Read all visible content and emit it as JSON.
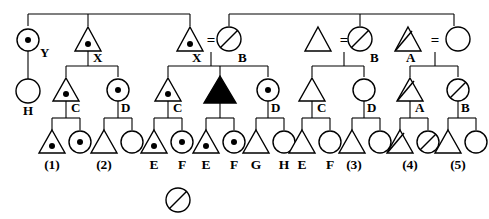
{
  "diagram": {
    "colors": {
      "stroke": "#000000",
      "fill_open": "#ffffff",
      "fill_affected": "#000000"
    },
    "symbol_legend": {
      "triangle": "male",
      "circle": "female",
      "dot": "carrier-dot-marker",
      "slash": "slash-marker",
      "filled": "affected-filled",
      "equals": "mating-union"
    },
    "union_symbol": "=",
    "generations": [
      {
        "name": "generation-1",
        "y": 40,
        "individuals": [
          {
            "id": "g1-1",
            "shape": "circle",
            "marker": "dot",
            "label": "Y",
            "x": 28
          },
          {
            "id": "g1-2",
            "shape": "triangle",
            "marker": "dot",
            "label": "X",
            "x": 88
          },
          {
            "id": "g1-3",
            "shape": "triangle",
            "marker": "dot",
            "label": "X",
            "x": 190
          },
          {
            "id": "g1-4",
            "shape": "circle",
            "marker": "slash",
            "label": "B",
            "x": 229
          },
          {
            "id": "g1-5",
            "shape": "triangle",
            "marker": "none",
            "label": "",
            "x": 318
          },
          {
            "id": "g1-6",
            "shape": "circle",
            "marker": "slash",
            "label": "B",
            "x": 360
          },
          {
            "id": "g1-7",
            "shape": "triangle",
            "marker": "slash",
            "label": "A",
            "x": 408
          },
          {
            "id": "g1-8",
            "shape": "circle",
            "marker": "none",
            "label": "",
            "x": 454
          }
        ]
      },
      {
        "name": "generation-2",
        "y": 90,
        "individuals": [
          {
            "id": "g2-1",
            "shape": "circle",
            "marker": "none",
            "label": "H",
            "x": 28
          },
          {
            "id": "g2-2",
            "shape": "triangle",
            "marker": "dot",
            "label": "C",
            "x": 66
          },
          {
            "id": "g2-3",
            "shape": "circle",
            "marker": "dot",
            "label": "D",
            "x": 118
          },
          {
            "id": "g2-4",
            "shape": "triangle",
            "marker": "dot",
            "label": "C",
            "x": 168
          },
          {
            "id": "g2-5",
            "shape": "triangle",
            "marker": "filled",
            "label": "",
            "x": 220
          },
          {
            "id": "g2-6",
            "shape": "circle",
            "marker": "dot",
            "label": "D",
            "x": 268
          },
          {
            "id": "g2-7",
            "shape": "triangle",
            "marker": "none",
            "label": "C",
            "x": 312
          },
          {
            "id": "g2-8",
            "shape": "circle",
            "marker": "none",
            "label": "D",
            "x": 364
          },
          {
            "id": "g2-9",
            "shape": "triangle",
            "marker": "slash",
            "label": "A",
            "x": 410
          },
          {
            "id": "g2-10",
            "shape": "circle",
            "marker": "slash",
            "label": "B",
            "x": 458
          }
        ]
      },
      {
        "name": "generation-3",
        "y": 141,
        "individuals": [
          {
            "id": "g3-1",
            "shape": "triangle",
            "marker": "dot",
            "label": "(1)",
            "x": 52
          },
          {
            "id": "g3-2",
            "shape": "circle",
            "marker": "dot",
            "label": "",
            "x": 80
          },
          {
            "id": "g3-3",
            "shape": "triangle",
            "marker": "none",
            "label": "(2)",
            "x": 104
          },
          {
            "id": "g3-4",
            "shape": "circle",
            "marker": "none",
            "label": "",
            "x": 132
          },
          {
            "id": "g3-5",
            "shape": "triangle",
            "marker": "dot",
            "label": "E",
            "x": 154
          },
          {
            "id": "g3-6",
            "shape": "circle",
            "marker": "dot",
            "label": "F",
            "x": 182
          },
          {
            "id": "g3-7",
            "shape": "triangle",
            "marker": "dot",
            "label": "E",
            "x": 206
          },
          {
            "id": "g3-8",
            "shape": "circle",
            "marker": "dot",
            "label": "F",
            "x": 234
          },
          {
            "id": "g3-9",
            "shape": "triangle",
            "marker": "none",
            "label": "G",
            "x": 256
          },
          {
            "id": "g3-10",
            "shape": "circle",
            "marker": "none",
            "label": "H",
            "x": 284
          },
          {
            "id": "g3-11",
            "shape": "triangle",
            "marker": "none",
            "label": "E",
            "x": 302
          },
          {
            "id": "g3-12",
            "shape": "circle",
            "marker": "none",
            "label": "F",
            "x": 330
          },
          {
            "id": "g3-13",
            "shape": "triangle",
            "marker": "none",
            "label": "(3)",
            "x": 352
          },
          {
            "id": "g3-14",
            "shape": "circle",
            "marker": "none",
            "label": "",
            "x": 380
          },
          {
            "id": "g3-15",
            "shape": "triangle",
            "marker": "slash",
            "label": "(4)",
            "x": 400
          },
          {
            "id": "g3-16",
            "shape": "circle",
            "marker": "slash",
            "label": "",
            "x": 428
          },
          {
            "id": "g3-17",
            "shape": "triangle",
            "marker": "none",
            "label": "(5)",
            "x": 448
          },
          {
            "id": "g3-18",
            "shape": "circle",
            "marker": "none",
            "label": "",
            "x": 476
          }
        ]
      }
    ],
    "standalone": {
      "name": "legend-circle-slash",
      "shape": "circle",
      "marker": "slash",
      "x": 178,
      "y": 200,
      "label": ""
    },
    "bottom_labels": [
      {
        "text": "(1)",
        "x": 52
      },
      {
        "text": "(2)",
        "x": 104
      },
      {
        "text": "E",
        "x": 154
      },
      {
        "text": "F",
        "x": 182
      },
      {
        "text": "E",
        "x": 206
      },
      {
        "text": "F",
        "x": 234
      },
      {
        "text": "G",
        "x": 256
      },
      {
        "text": "H",
        "x": 284
      },
      {
        "text": "E",
        "x": 302
      },
      {
        "text": "F",
        "x": 330
      },
      {
        "text": "(3)",
        "x": 352
      },
      {
        "text": "(4)",
        "x": 400
      },
      {
        "text": "(5)",
        "x": 448
      }
    ],
    "inline_labels": [
      {
        "text": "Y",
        "x": 40,
        "y": 52
      },
      {
        "text": "X",
        "x": 99,
        "y": 57
      },
      {
        "text": "X",
        "x": 197,
        "y": 57
      },
      {
        "text": "B",
        "x": 245,
        "y": 57
      },
      {
        "text": "B",
        "x": 374,
        "y": 57
      },
      {
        "text": "A",
        "x": 412,
        "y": 57
      },
      {
        "text": "H",
        "x": 28,
        "y": 114
      },
      {
        "text": "C",
        "x": 78,
        "y": 104
      },
      {
        "text": "D",
        "x": 126,
        "y": 104
      },
      {
        "text": "C",
        "x": 180,
        "y": 104
      },
      {
        "text": "D",
        "x": 276,
        "y": 104
      },
      {
        "text": "C",
        "x": 324,
        "y": 104
      },
      {
        "text": "D",
        "x": 372,
        "y": 104
      },
      {
        "text": "A",
        "x": 420,
        "y": 104
      },
      {
        "text": "B",
        "x": 466,
        "y": 104
      }
    ],
    "unions": [
      {
        "name": "union-X-B",
        "x": 211,
        "y": 40
      },
      {
        "name": "union-tri-B",
        "x": 340,
        "y": 40
      },
      {
        "name": "union-A-circ",
        "x": 432,
        "y": 40
      }
    ]
  }
}
